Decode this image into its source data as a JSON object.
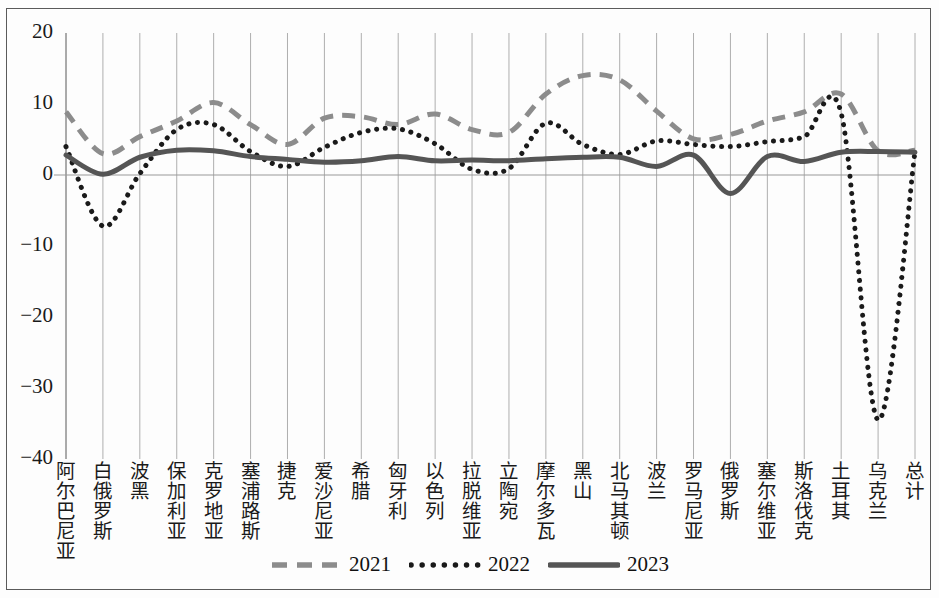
{
  "chart_data": {
    "type": "line",
    "title": "",
    "subtitle": "",
    "xlabel": "",
    "ylabel": "",
    "ylim": [
      -40,
      20
    ],
    "yticks": [
      20,
      10,
      0,
      -10,
      -20,
      -30,
      -40
    ],
    "ytick_labels": [
      "20",
      "10",
      "0",
      "−10",
      "−20",
      "−30",
      "−40"
    ],
    "grid": "vertical gridlines at each category; horizontal zero line",
    "legend_position": "bottom-center",
    "categories": [
      "阿尔巴尼亚",
      "白俄罗斯",
      "波黑",
      "保加利亚",
      "克罗地亚",
      "塞浦路斯",
      "捷克",
      "爱沙尼亚",
      "希腊",
      "匈牙利",
      "以色列",
      "拉脱维亚",
      "立陶宛",
      "摩尔多瓦",
      "黑山",
      "北马其顿",
      "波兰",
      "罗马尼亚",
      "俄罗斯",
      "塞尔维亚",
      "斯洛伐克",
      "土耳其",
      "乌克兰",
      "总计"
    ],
    "series": [
      {
        "name": "2021",
        "style": "dashed",
        "color": "#8c8c8c",
        "values": [
          8.9,
          3.0,
          5.4,
          7.6,
          10.2,
          7.1,
          4.3,
          8.0,
          8.2,
          7.1,
          8.6,
          6.4,
          6.0,
          11.4,
          14.0,
          13.4,
          9.0,
          5.1,
          5.7,
          7.6,
          8.9,
          11.4,
          3.4,
          3.5
        ]
      },
      {
        "name": "2022",
        "style": "dotted",
        "color": "#1a1a1a",
        "values": [
          4.0,
          -7.2,
          0.2,
          6.4,
          7.1,
          3.3,
          1.2,
          3.9,
          6.0,
          6.5,
          4.4,
          0.8,
          0.9,
          7.3,
          4.3,
          2.9,
          4.8,
          4.3,
          4.0,
          4.7,
          5.4,
          8.7,
          -34.5,
          3.3
        ]
      },
      {
        "name": "2023",
        "style": "solid",
        "color": "#555555",
        "values": [
          2.8,
          0.1,
          2.5,
          3.5,
          3.4,
          2.6,
          2.2,
          1.8,
          2.0,
          2.6,
          2.0,
          2.1,
          2.0,
          2.3,
          2.5,
          2.5,
          1.2,
          2.8,
          -2.6,
          2.6,
          1.9,
          3.2,
          3.3,
          3.2
        ]
      }
    ]
  },
  "axes": {
    "y_tick_labels": [
      "20",
      "10",
      "0",
      "−10",
      "−20",
      "−30",
      "−40"
    ],
    "x_tick_labels": [
      "阿尔巴尼亚",
      "白俄罗斯",
      "波黑",
      "保加利亚",
      "克罗地亚",
      "塞浦路斯",
      "捷克",
      "爱沙尼亚",
      "希腊",
      "匈牙利",
      "以色列",
      "拉脱维亚",
      "立陶宛",
      "摩尔多瓦",
      "黑山",
      "北马其顿",
      "波兰",
      "罗马尼亚",
      "俄罗斯",
      "塞尔维亚",
      "斯洛伐克",
      "土耳其",
      "乌克兰",
      "总计"
    ]
  },
  "legend": {
    "items": [
      {
        "label": "2021",
        "style": "dashed",
        "color": "#8c8c8c"
      },
      {
        "label": "2022",
        "style": "dotted",
        "color": "#1a1a1a"
      },
      {
        "label": "2023",
        "style": "solid",
        "color": "#555555"
      }
    ]
  }
}
